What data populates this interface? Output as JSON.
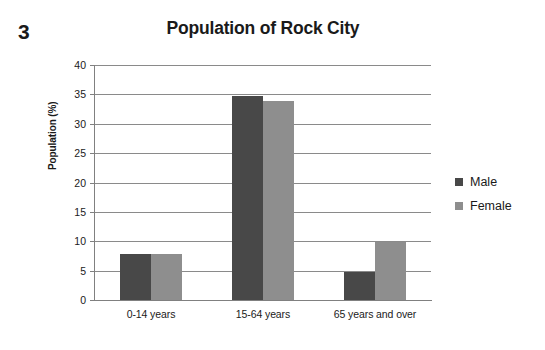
{
  "figure": {
    "number": "3"
  },
  "chart_data": {
    "type": "bar",
    "title": "Population of Rock City",
    "xlabel": "",
    "ylabel": "Population (%)",
    "categories": [
      "0-14 years",
      "15-64 years",
      "65 years and over"
    ],
    "series": [
      {
        "name": "Male",
        "color": "#484848",
        "values": [
          7.8,
          34.8,
          4.8
        ]
      },
      {
        "name": "Female",
        "color": "#8e8e8e",
        "values": [
          7.8,
          33.8,
          9.8
        ]
      }
    ],
    "ylim": [
      0,
      40
    ],
    "ytick_step": 5,
    "yticks": [
      "40",
      "35",
      "30",
      "25",
      "20",
      "15",
      "10",
      "5",
      "0"
    ],
    "grid": true,
    "grid_axis": "y",
    "legend_position": "right",
    "bar_grouping": "grouped"
  }
}
